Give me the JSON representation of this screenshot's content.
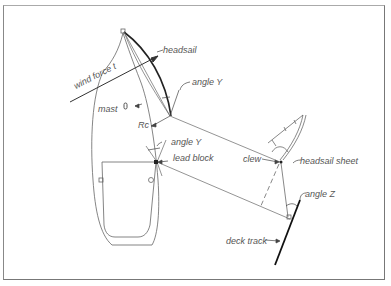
{
  "diagram": {
    "type": "headsail sheeting geometry",
    "labels": {
      "headsail": "headsail",
      "wind_force": "wind force t",
      "angle_y_top": "angle Y",
      "mast": "mast",
      "rc": "Rc",
      "angle_y_lower": "angle Y",
      "lead_block": "lead block",
      "clew": "clew",
      "headsail_sheet": "headsail sheet",
      "angle_z": "angle Z",
      "deck_track": "deck track"
    },
    "colors": {
      "line": "#555555",
      "heavy_line": "#222222",
      "text": "#555555",
      "frame": "#777777",
      "background": "#ffffff"
    }
  }
}
